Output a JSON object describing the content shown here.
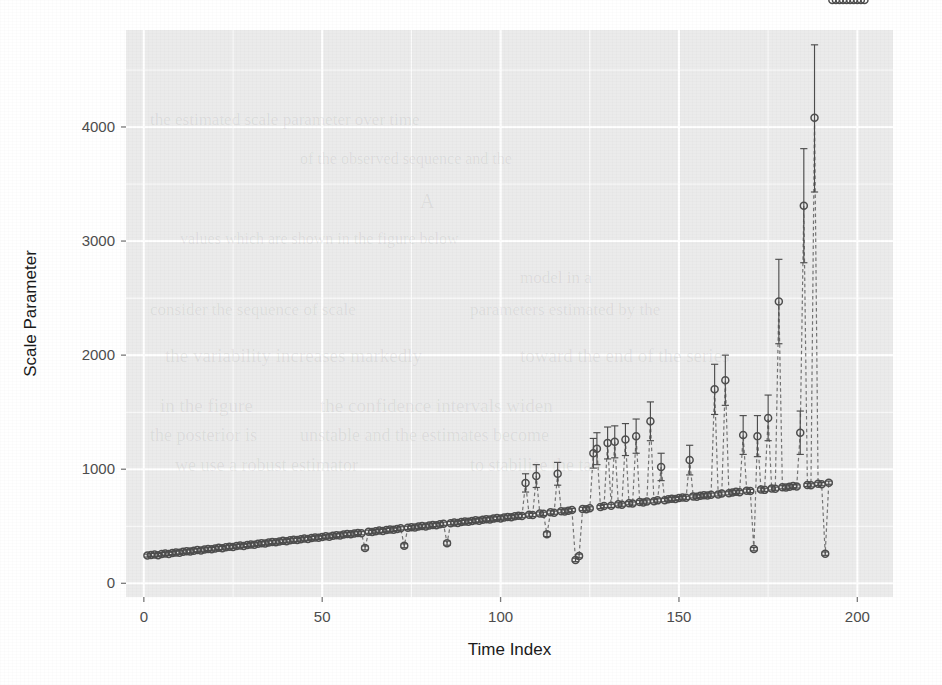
{
  "figure": {
    "background_color": "#ffffff",
    "panel_color": "#ebebeb",
    "gridline_color": "#ffffff",
    "point_color": "#4d4d4d",
    "line_color": "#6e6e6e",
    "errorbar_color": "#4d4d4d"
  },
  "ghost_page_text": [
    {
      "text": "the estimated scale parameter over time",
      "x": 150,
      "y": 110,
      "size": 17
    },
    {
      "text": "of the observed sequence and the",
      "x": 300,
      "y": 150,
      "size": 16
    },
    {
      "text": "A",
      "x": 420,
      "y": 190,
      "size": 20
    },
    {
      "text": "values which are shown in the figure below",
      "x": 180,
      "y": 230,
      "size": 16
    },
    {
      "text": "model in a",
      "x": 520,
      "y": 268,
      "size": 17
    },
    {
      "text": "consider the sequence of scale",
      "x": 150,
      "y": 300,
      "size": 17
    },
    {
      "text": "parameters estimated by the",
      "x": 470,
      "y": 300,
      "size": 17
    },
    {
      "text": "the variability increases markedly",
      "x": 165,
      "y": 345,
      "size": 19
    },
    {
      "text": "toward the end of the series",
      "x": 520,
      "y": 345,
      "size": 19
    },
    {
      "text": "in the figure",
      "x": 160,
      "y": 395,
      "size": 19
    },
    {
      "text": "the confidence intervals widen",
      "x": 320,
      "y": 395,
      "size": 19
    },
    {
      "text": "the posterior is",
      "x": 150,
      "y": 425,
      "size": 18
    },
    {
      "text": "unstable and the estimates become",
      "x": 300,
      "y": 425,
      "size": 18
    },
    {
      "text": "we use a robust estimator",
      "x": 175,
      "y": 455,
      "size": 18
    },
    {
      "text": "to stabilise the tail",
      "x": 470,
      "y": 455,
      "size": 18
    }
  ],
  "chart_data": {
    "type": "scatter",
    "title": "",
    "xlabel": "Time Index",
    "ylabel": "Scale Parameter",
    "xlim": [
      -5,
      210
    ],
    "ylim": [
      -120,
      4850
    ],
    "xticks": [
      0,
      50,
      100,
      150,
      200
    ],
    "yticks": [
      0,
      1000,
      2000,
      3000,
      4000
    ],
    "grid": true,
    "minor_grid": true,
    "legend": "none",
    "marker": "open-circle",
    "line_style": "dashed",
    "has_error_bars": true,
    "series_name": "Scale Parameter Estimate",
    "x": [
      1,
      2,
      3,
      4,
      5,
      6,
      7,
      8,
      9,
      10,
      11,
      12,
      13,
      14,
      15,
      16,
      17,
      18,
      19,
      20,
      21,
      22,
      23,
      24,
      25,
      26,
      27,
      28,
      29,
      30,
      31,
      32,
      33,
      34,
      35,
      36,
      37,
      38,
      39,
      40,
      41,
      42,
      43,
      44,
      45,
      46,
      47,
      48,
      49,
      50,
      51,
      52,
      53,
      54,
      55,
      56,
      57,
      58,
      59,
      60,
      61,
      62,
      63,
      64,
      65,
      66,
      67,
      68,
      69,
      70,
      71,
      72,
      73,
      74,
      75,
      76,
      77,
      78,
      79,
      80,
      81,
      82,
      83,
      84,
      85,
      86,
      87,
      88,
      89,
      90,
      91,
      92,
      93,
      94,
      95,
      96,
      97,
      98,
      99,
      100,
      101,
      102,
      103,
      104,
      105,
      106,
      107,
      108,
      109,
      110,
      111,
      112,
      113,
      114,
      115,
      116,
      117,
      118,
      119,
      120,
      121,
      122,
      123,
      124,
      125,
      126,
      127,
      128,
      129,
      130,
      131,
      132,
      133,
      134,
      135,
      136,
      137,
      138,
      139,
      140,
      141,
      142,
      143,
      144,
      145,
      146,
      147,
      148,
      149,
      150,
      151,
      152,
      153,
      154,
      155,
      156,
      157,
      158,
      159,
      160,
      161,
      162,
      163,
      164,
      165,
      166,
      167,
      168,
      169,
      170,
      171,
      172,
      173,
      174,
      175,
      176,
      177,
      178,
      179,
      180,
      181,
      182,
      183,
      184,
      185,
      186,
      187,
      188,
      189,
      190,
      191,
      192,
      193,
      194,
      195,
      196,
      197,
      198,
      199,
      200,
      201,
      202
    ],
    "y": [
      243,
      248,
      252,
      247,
      256,
      261,
      258,
      266,
      271,
      268,
      276,
      281,
      278,
      286,
      291,
      288,
      296,
      301,
      299,
      306,
      311,
      308,
      316,
      321,
      319,
      326,
      331,
      328,
      336,
      341,
      339,
      346,
      352,
      349,
      357,
      362,
      359,
      366,
      372,
      369,
      377,
      382,
      379,
      386,
      392,
      389,
      397,
      402,
      399,
      406,
      412,
      409,
      417,
      422,
      419,
      427,
      432,
      429,
      437,
      442,
      439,
      310,
      452,
      449,
      457,
      462,
      459,
      467,
      472,
      469,
      477,
      482,
      329,
      486,
      492,
      489,
      497,
      502,
      499,
      506,
      512,
      509,
      517,
      522,
      352,
      527,
      532,
      529,
      537,
      542,
      539,
      547,
      552,
      549,
      557,
      562,
      559,
      567,
      572,
      569,
      577,
      582,
      579,
      587,
      592,
      589,
      880,
      602,
      599,
      940,
      612,
      609,
      430,
      622,
      619,
      960,
      632,
      629,
      637,
      642,
      205,
      240,
      652,
      649,
      657,
      1140,
      1180,
      669,
      677,
      1230,
      679,
      1240,
      692,
      689,
      1260,
      702,
      699,
      1290,
      712,
      709,
      717,
      1420,
      719,
      727,
      1020,
      729,
      737,
      742,
      739,
      747,
      752,
      749,
      1080,
      762,
      759,
      767,
      772,
      769,
      777,
      1700,
      779,
      787,
      1780,
      789,
      797,
      802,
      799,
      1300,
      812,
      809,
      300,
      1290,
      822,
      819,
      1450,
      832,
      829,
      2470,
      842,
      839,
      847,
      852,
      849,
      1320,
      3310,
      862,
      859,
      4080,
      872,
      869,
      260,
      882
    ],
    "ymin": [
      230,
      234,
      238,
      233,
      242,
      247,
      244,
      252,
      257,
      254,
      262,
      267,
      264,
      272,
      277,
      274,
      282,
      287,
      285,
      292,
      297,
      294,
      302,
      307,
      305,
      312,
      317,
      314,
      322,
      327,
      325,
      332,
      338,
      335,
      343,
      348,
      345,
      352,
      358,
      355,
      363,
      368,
      365,
      372,
      378,
      375,
      383,
      388,
      385,
      392,
      398,
      395,
      403,
      408,
      405,
      413,
      418,
      415,
      423,
      428,
      425,
      293,
      438,
      435,
      443,
      448,
      445,
      453,
      458,
      455,
      463,
      468,
      312,
      472,
      478,
      475,
      483,
      488,
      485,
      492,
      498,
      495,
      503,
      508,
      334,
      513,
      518,
      515,
      523,
      528,
      525,
      533,
      538,
      535,
      543,
      548,
      545,
      553,
      558,
      555,
      563,
      568,
      565,
      573,
      578,
      575,
      800,
      588,
      585,
      840,
      598,
      595,
      410,
      608,
      605,
      860,
      618,
      615,
      623,
      628,
      190,
      224,
      638,
      635,
      643,
      1010,
      1040,
      655,
      663,
      1090,
      665,
      1100,
      678,
      675,
      1120,
      688,
      685,
      1140,
      698,
      695,
      703,
      1250,
      705,
      713,
      900,
      715,
      723,
      728,
      725,
      733,
      738,
      735,
      950,
      748,
      745,
      753,
      758,
      755,
      763,
      1480,
      765,
      773,
      1560,
      775,
      783,
      788,
      785,
      1130,
      798,
      795,
      285,
      1110,
      808,
      805,
      1250,
      818,
      815,
      2100,
      828,
      825,
      833,
      838,
      835,
      1130,
      2810,
      848,
      845,
      3430,
      858,
      855,
      245,
      868
    ],
    "ymax": [
      256,
      262,
      266,
      261,
      270,
      275,
      272,
      280,
      285,
      282,
      290,
      295,
      292,
      300,
      305,
      302,
      310,
      315,
      313,
      320,
      325,
      322,
      330,
      335,
      333,
      340,
      345,
      342,
      350,
      355,
      353,
      360,
      366,
      363,
      371,
      376,
      373,
      380,
      386,
      383,
      391,
      396,
      393,
      400,
      406,
      403,
      411,
      416,
      413,
      420,
      426,
      423,
      431,
      436,
      433,
      441,
      446,
      443,
      451,
      456,
      453,
      327,
      466,
      463,
      471,
      476,
      473,
      481,
      486,
      483,
      491,
      496,
      346,
      500,
      506,
      503,
      511,
      516,
      513,
      520,
      526,
      523,
      531,
      536,
      370,
      541,
      546,
      543,
      551,
      556,
      553,
      561,
      566,
      563,
      571,
      576,
      573,
      581,
      586,
      583,
      591,
      596,
      593,
      601,
      606,
      603,
      960,
      616,
      613,
      1040,
      626,
      623,
      450,
      636,
      633,
      1060,
      646,
      643,
      651,
      656,
      220,
      256,
      666,
      663,
      671,
      1270,
      1320,
      683,
      691,
      1370,
      693,
      1380,
      706,
      703,
      1400,
      716,
      713,
      1440,
      726,
      723,
      731,
      1590,
      733,
      741,
      1140,
      743,
      751,
      756,
      753,
      761,
      766,
      763,
      1210,
      776,
      773,
      781,
      786,
      783,
      791,
      1920,
      793,
      801,
      2000,
      803,
      811,
      816,
      813,
      1470,
      826,
      823,
      315,
      1470,
      836,
      833,
      1650,
      846,
      843,
      2840,
      856,
      853,
      861,
      866,
      863,
      1510,
      3810,
      876,
      873,
      4720,
      886,
      883,
      275,
      896
    ]
  }
}
